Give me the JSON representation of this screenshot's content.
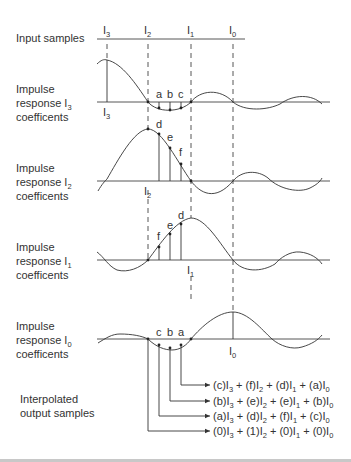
{
  "rows": {
    "input": {
      "label": "Input samples"
    },
    "i3": {
      "label_line1": "Impulse",
      "label_line2": "response I",
      "label_sub": "3",
      "label_line3": "coefficents"
    },
    "i2": {
      "label_line1": "Impulse",
      "label_line2": "response I",
      "label_sub": "2",
      "label_line3": "coefficents"
    },
    "i1": {
      "label_line1": "Impulse",
      "label_line2": "response I",
      "label_sub": "1",
      "label_line3": "coefficents"
    },
    "i0": {
      "label_line1": "Impulse",
      "label_line2": "response I",
      "label_sub": "0",
      "label_line3": "coefficents"
    },
    "output": {
      "label_line1": "Interpolated",
      "label_line2": "output samples"
    }
  },
  "samples": [
    {
      "name": "I",
      "sub": "3"
    },
    {
      "name": "I",
      "sub": "2"
    },
    {
      "name": "I",
      "sub": "1"
    },
    {
      "name": "I",
      "sub": "0"
    }
  ],
  "plot_labels": {
    "i3": {
      "sample": "I",
      "sub": "3",
      "coeffs": [
        "a",
        "b",
        "c"
      ]
    },
    "i2": {
      "sample": "I",
      "sub": "2",
      "coeffs": [
        "d",
        "e",
        "f"
      ]
    },
    "i1": {
      "sample": "I",
      "sub": "1",
      "coeffs": [
        "f",
        "e",
        "d"
      ]
    },
    "i0": {
      "sample": "I",
      "sub": "0",
      "coeffs": [
        "c",
        "b",
        "a"
      ]
    }
  },
  "outputs": [
    {
      "terms": [
        [
          "(c)I",
          "3"
        ],
        [
          " + (f)I",
          "2"
        ],
        [
          " + (d)I",
          "1"
        ],
        [
          " + (a)I",
          "0"
        ]
      ]
    },
    {
      "terms": [
        [
          "(b)I",
          "3"
        ],
        [
          " + (e)I",
          "2"
        ],
        [
          " + (e)I",
          "1"
        ],
        [
          " + (b)I",
          "0"
        ]
      ]
    },
    {
      "terms": [
        [
          "(a)I",
          "3"
        ],
        [
          " + (d)I",
          "2"
        ],
        [
          " + (f)I",
          "1"
        ],
        [
          " + (c)I",
          "0"
        ]
      ]
    },
    {
      "terms": [
        [
          "(0)I",
          "3"
        ],
        [
          " + (1)I",
          "2"
        ],
        [
          " + (0)I",
          "1"
        ],
        [
          " + (0)I",
          "0"
        ]
      ]
    }
  ]
}
